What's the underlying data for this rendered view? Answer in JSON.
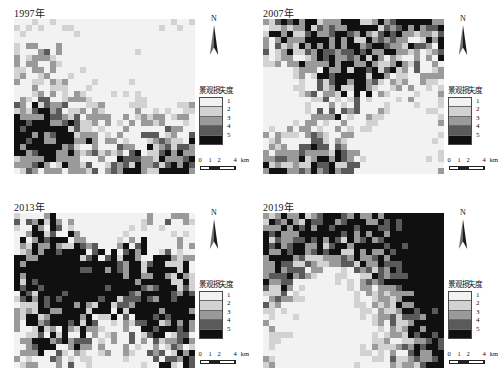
{
  "figure": {
    "kind": "landscape-loss-degree-raster-map-series",
    "panel_count": 4
  },
  "legend": {
    "title": "景观损失度",
    "classes": [
      {
        "label": "1",
        "color": "#f2f2f2"
      },
      {
        "label": "2",
        "color": "#d2d2d2"
      },
      {
        "label": "3",
        "color": "#9a9a9a"
      },
      {
        "label": "4",
        "color": "#5a5a5a"
      },
      {
        "label": "5",
        "color": "#101010"
      }
    ]
  },
  "north_arrow": {
    "label": "N"
  },
  "scale_bar": {
    "ticks": [
      "0",
      "1",
      "2",
      "4"
    ],
    "unit": "km",
    "full_label": "0 1 2  4 km"
  },
  "panels": [
    {
      "id": "panel-1997",
      "title": "1997年",
      "year": 1997
    },
    {
      "id": "panel-2007",
      "title": "2007年",
      "year": 2007
    },
    {
      "id": "panel-2013",
      "title": "2013年",
      "year": 2013
    },
    {
      "id": "panel-2019",
      "title": "2019年",
      "year": 2019
    }
  ],
  "chart_data": {
    "type": "heatmap",
    "title": "景观损失度",
    "subtitle": "",
    "xlabel": "",
    "ylabel": "",
    "grid": false,
    "legend_position": "right",
    "value_labels": [
      "1",
      "2",
      "3",
      "4",
      "5"
    ],
    "colormap": [
      "#f2f2f2",
      "#d2d2d2",
      "#9a9a9a",
      "#5a5a5a",
      "#101010"
    ],
    "ncols": 30,
    "nrows": 26,
    "panels": [
      {
        "name": "1997年",
        "mean_class": 1.85,
        "class_fractions": [
          0.55,
          0.13,
          0.17,
          0.06,
          0.09
        ],
        "seed": 1997
      },
      {
        "name": "2007年",
        "mean_class": 2.25,
        "class_fractions": [
          0.41,
          0.15,
          0.21,
          0.09,
          0.14
        ],
        "seed": 2007
      },
      {
        "name": "2013年",
        "mean_class": 3.15,
        "class_fractions": [
          0.28,
          0.11,
          0.14,
          0.1,
          0.37
        ],
        "seed": 2013
      },
      {
        "name": "2019年",
        "mean_class": 3.05,
        "class_fractions": [
          0.3,
          0.12,
          0.16,
          0.11,
          0.31
        ],
        "seed": 2019
      }
    ]
  }
}
